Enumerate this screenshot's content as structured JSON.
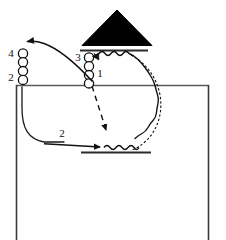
{
  "figure": {
    "title": "",
    "background_color": "#ffffff",
    "stroke_color": "#1a1a1a",
    "fill_color": "#000000",
    "width": 226,
    "height": 240
  },
  "labels": {
    "one": "1",
    "two_left": "2",
    "two_bottom": "2",
    "three": "3",
    "four": "4"
  },
  "elements": {
    "triangle_name": "filled-triangle",
    "top_bar_name": "upper-horizontal-bar",
    "bottom_bar_name": "lower-horizontal-bar",
    "left_chain_name": "left-circle-chain",
    "right_chain_name": "right-circle-chain",
    "outer_box_name": "outer-open-box",
    "curved_arrow_name": "long-curved-arrow",
    "dashed_arrow_name": "dashed-arrow",
    "straight_arrow_name": "straight-arrow",
    "wavy_big_name": "large-wavy-arc",
    "wavy_top_name": "top-wavy-segment",
    "wavy_bottom_name": "bottom-wavy-segment",
    "inner_curve_name": "inner-curve-path"
  }
}
